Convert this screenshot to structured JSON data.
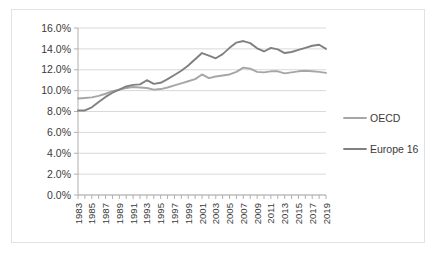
{
  "chart_data": {
    "type": "line",
    "title": "",
    "subtitle": "",
    "xlabel": "",
    "ylabel": "",
    "grid": true,
    "legend_position": "right",
    "ylim": [
      0,
      0.16
    ],
    "ytick_labels": [
      "16.0%",
      "14.0%",
      "12.0%",
      "10.0%",
      "8.0%",
      "6.0%",
      "4.0%",
      "2.0%",
      "0.0%"
    ],
    "ytick_values": [
      16.0,
      14.0,
      12.0,
      10.0,
      8.0,
      6.0,
      4.0,
      2.0,
      0.0
    ],
    "x": [
      1983,
      1984,
      1985,
      1986,
      1987,
      1988,
      1989,
      1990,
      1991,
      1992,
      1993,
      1994,
      1995,
      1996,
      1997,
      1998,
      1999,
      2000,
      2001,
      2002,
      2003,
      2004,
      2005,
      2006,
      2007,
      2008,
      2009,
      2010,
      2011,
      2012,
      2013,
      2014,
      2015,
      2016,
      2017,
      2018,
      2019
    ],
    "xtick_labels": [
      "1983",
      "1985",
      "1987",
      "1989",
      "1991",
      "1993",
      "1995",
      "1997",
      "1999",
      "2001",
      "2003",
      "2005",
      "2007",
      "2009",
      "2011",
      "2013",
      "2015",
      "2017",
      "2019"
    ],
    "xlim": [
      1983,
      2019
    ],
    "series": [
      {
        "name": "OECD",
        "color": "#a6a6a6",
        "values": [
          9.25,
          9.3,
          9.35,
          9.5,
          9.7,
          9.95,
          10.1,
          10.25,
          10.35,
          10.3,
          10.25,
          10.1,
          10.15,
          10.3,
          10.5,
          10.7,
          10.9,
          11.1,
          11.55,
          11.2,
          11.35,
          11.45,
          11.55,
          11.8,
          12.2,
          12.1,
          11.8,
          11.75,
          11.85,
          11.85,
          11.65,
          11.75,
          11.85,
          11.9,
          11.85,
          11.8,
          11.7
        ]
      },
      {
        "name": "Europe 16",
        "color": "#808080",
        "values": [
          8.1,
          8.1,
          8.4,
          8.9,
          9.4,
          9.8,
          10.1,
          10.4,
          10.55,
          10.6,
          11.0,
          10.65,
          10.75,
          11.1,
          11.5,
          11.9,
          12.4,
          13.0,
          13.6,
          13.35,
          13.1,
          13.5,
          14.1,
          14.6,
          14.75,
          14.55,
          14.05,
          13.75,
          14.1,
          13.95,
          13.6,
          13.7,
          13.9,
          14.1,
          14.3,
          14.4,
          14.0
        ]
      }
    ]
  },
  "legend": {
    "entries": [
      {
        "label": "OECD",
        "color": "#a6a6a6"
      },
      {
        "label": "Europe 16",
        "color": "#808080"
      }
    ]
  }
}
